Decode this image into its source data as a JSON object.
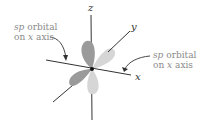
{
  "diagram": {
    "axes": {
      "z_label": "z",
      "y_label": "y",
      "x_label": "x"
    },
    "annotations": {
      "left": {
        "line1_italic": "sp",
        "line1_rest": " orbital",
        "line2_prefix": "on ",
        "line2_italic": "x",
        "line2_rest": " axis"
      },
      "right": {
        "line1_italic": "sp",
        "line1_rest": " orbital",
        "line2_prefix": "on ",
        "line2_italic": "x",
        "line2_rest": " axis"
      }
    },
    "colors": {
      "dark_lobe": "#9a9a9a",
      "light_lobe": "#d6d6d6",
      "axis_line": "#333333",
      "label_text": "#8a8a8a"
    }
  }
}
